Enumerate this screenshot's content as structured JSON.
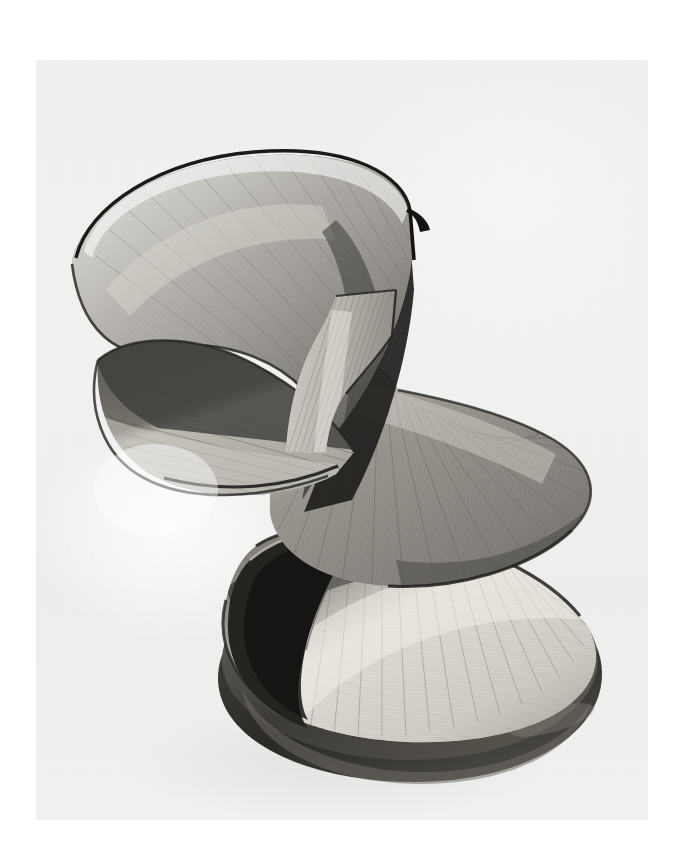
{
  "page": {
    "background_color": "#ffffff",
    "medium": "black-and-white photographic print on paper"
  },
  "photo": {
    "alt_text": "Black and white photograph of an abstract string sculpture",
    "subject": "abstract stringed / wire sculpture",
    "description": "Three interlocking ruled surfaces built from hundreds of taut parallel wires spiral upward from a dark elliptical base; an upper conoid fan tilts to the left, a broad middle fan flares to the right, and a narrow hyperboloid waist links them.",
    "background_color": "#f1f1f0",
    "frame": {
      "left": 36,
      "top": 60,
      "width": 612,
      "height": 760
    },
    "palette": {
      "paper_white": "#ffffff",
      "print_background": "#f1f1f0",
      "wire_light": "#d7d5d0",
      "wire_mid": "#9b9892",
      "wire_dark": "#56544f",
      "shadow_black": "#1d1c1a",
      "base_dark": "#3a3834",
      "base_highlight": "#6e6b65",
      "rim_edge": "#262522"
    },
    "elements": [
      {
        "name": "upper-conoid-fan",
        "label": "Upper conoid fan",
        "tone": "light-to-mid gray, rim lit along top edge"
      },
      {
        "name": "left-lower-lobe",
        "label": "Left lower lobe",
        "tone": "dark upper band over lighter lower band"
      },
      {
        "name": "central-shadow-web",
        "label": "Central shadow web",
        "tone": "deep shadow between the fans"
      },
      {
        "name": "hyperboloid-waist",
        "label": "Hyperboloid waist",
        "tone": "bright, narrow pinched column"
      },
      {
        "name": "middle-fan",
        "label": "Middle radial fan",
        "tone": "mid gray, radiating strands"
      },
      {
        "name": "lower-fan",
        "label": "Lower radial fan",
        "tone": "bright highlight sweeping diagonally"
      },
      {
        "name": "elliptical-base",
        "label": "Elliptical plinth base",
        "tone": "dark polished stone or wood"
      }
    ]
  }
}
